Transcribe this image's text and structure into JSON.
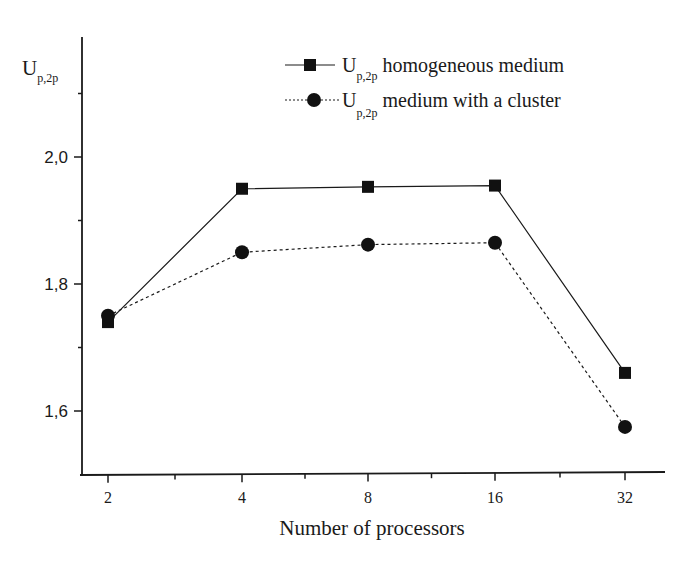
{
  "chart_data": {
    "type": "line",
    "title": "",
    "xlabel": "Number of processors",
    "ylabel": "U",
    "ylabel_subscript": "p,2p",
    "x": [
      2,
      4,
      8,
      16,
      32
    ],
    "x_tick_labels": [
      "2",
      "4",
      "8",
      "16",
      "32"
    ],
    "x_scale": "log2 (equally spaced categories)",
    "y_tick_labels": [
      "1,6",
      "1,8",
      "2,0"
    ],
    "y_ticks": [
      1.6,
      1.8,
      2.0
    ],
    "y_minor_ticks": [
      1.7,
      1.9,
      2.1
    ],
    "ylim": [
      1.49,
      2.19
    ],
    "grid": false,
    "legend_position": "upper right",
    "series": [
      {
        "name": "U p,2p homogeneous medium",
        "legend_main": "U",
        "legend_sub": "p,2p",
        "legend_rest": " homogeneous medium",
        "marker": "square",
        "line_style": "solid",
        "color": "#1a1a1a",
        "values": [
          1.74,
          1.95,
          1.953,
          1.955,
          1.66
        ]
      },
      {
        "name": "U p,2p medium with a cluster",
        "legend_main": "U",
        "legend_sub": "p,2p",
        "legend_rest": " medium with a cluster",
        "marker": "circle",
        "line_style": "dotted",
        "color": "#1a1a1a",
        "values": [
          1.75,
          1.85,
          1.862,
          1.865,
          1.575
        ]
      }
    ]
  }
}
